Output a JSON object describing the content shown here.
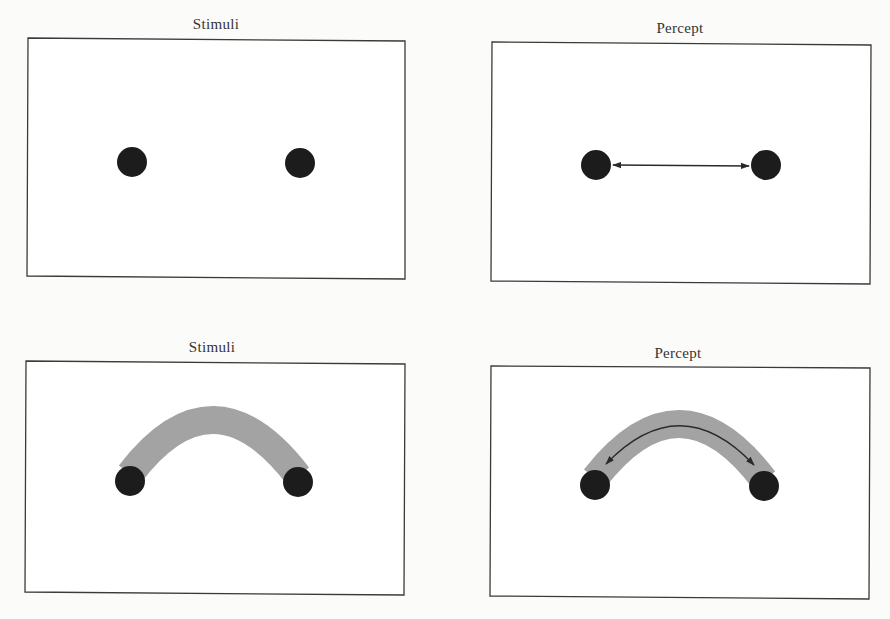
{
  "figure": {
    "panels": [
      {
        "id": "top-left",
        "title": "Stimuli",
        "content": "two separated dots"
      },
      {
        "id": "top-right",
        "title": "Percept",
        "content": "two dots with straight double-headed arrow (apparent motion along straight path)"
      },
      {
        "id": "bottom-left",
        "title": "Stimuli",
        "content": "two dots connected by gray curved band"
      },
      {
        "id": "bottom-right",
        "title": "Percept",
        "content": "two dots on gray curved band with curved double-headed arrow (apparent motion along curved path)"
      }
    ],
    "colors": {
      "dot": "#1c1c1c",
      "band": "#a3a3a3",
      "frame": "#3a3a3a",
      "background": "#fbfbfa",
      "panel_fill": "#ffffff"
    }
  }
}
